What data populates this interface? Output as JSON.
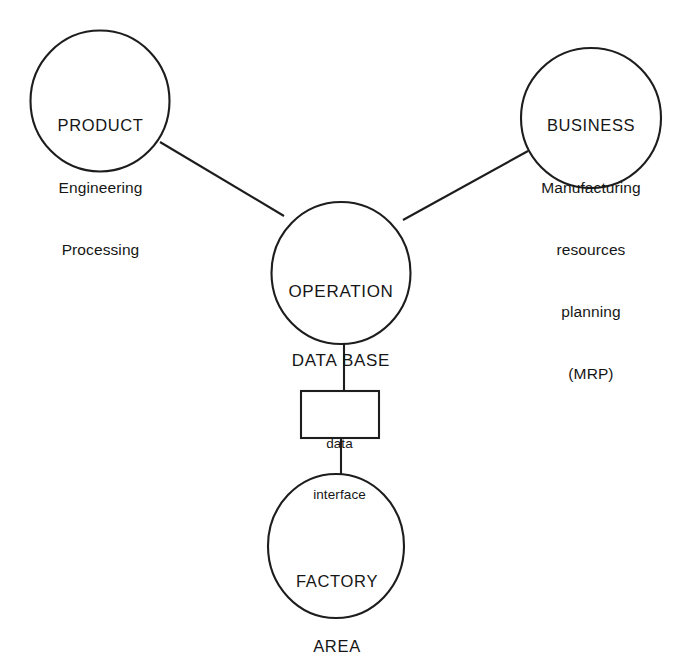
{
  "diagram": {
    "type": "node-link-diagram",
    "background_color": "#ffffff",
    "stroke_color": "#1d1d1d",
    "text_color": "#161616",
    "nodes": [
      {
        "id": "product",
        "shape": "circle",
        "lines": [
          "PRODUCT",
          "Engineering",
          "Processing"
        ],
        "text": "PRODUCT Engineering Processing",
        "center": {
          "x": 100,
          "y": 101
        },
        "radius": 70
      },
      {
        "id": "business",
        "shape": "circle",
        "lines": [
          "BUSINESS",
          "Manufacturing",
          "resources",
          "planning",
          "(MRP)"
        ],
        "text": "BUSINESS Manufacturing resources planning (MRP)",
        "center": {
          "x": 591,
          "y": 118
        },
        "radius": 70
      },
      {
        "id": "operation_data_base",
        "shape": "circle",
        "lines": [
          "OPERATION",
          "DATA BASE"
        ],
        "text": "OPERATION DATA BASE",
        "center": {
          "x": 341,
          "y": 273
        },
        "radius": 70
      },
      {
        "id": "data_interface",
        "shape": "rectangle",
        "lines": [
          "data",
          "interface"
        ],
        "text": "data interface",
        "rect": {
          "x": 301,
          "y": 391,
          "width": 78,
          "height": 47
        }
      },
      {
        "id": "factory_area",
        "shape": "circle",
        "lines": [
          "FACTORY",
          "AREA"
        ],
        "text": "FACTORY AREA",
        "center": {
          "x": 336,
          "y": 546
        },
        "radius": 69
      }
    ],
    "edges": [
      {
        "id": "product-to-operation",
        "from": "product",
        "to": "operation_data_base",
        "x1": 160,
        "y1": 142,
        "x2": 284,
        "y2": 216
      },
      {
        "id": "business-to-operation",
        "from": "business",
        "to": "operation_data_base",
        "x1": 528,
        "y1": 151,
        "x2": 403,
        "y2": 220
      },
      {
        "id": "operation-to-interface",
        "from": "operation_data_base",
        "to": "data_interface",
        "x1": 344,
        "y1": 343,
        "x2": 344,
        "y2": 391
      },
      {
        "id": "interface-to-factory",
        "from": "data_interface",
        "to": "factory_area",
        "x1": 341,
        "y1": 438,
        "x2": 341,
        "y2": 477
      }
    ]
  }
}
